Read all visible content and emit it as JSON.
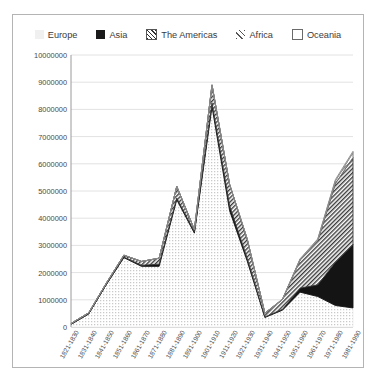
{
  "legend": {
    "position": "top-center",
    "entries": [
      {
        "label": "Europe",
        "swatch": "europe-dotted-swatch"
      },
      {
        "label": "Asia",
        "swatch": "asia-solid-swatch"
      },
      {
        "label": "The Americas",
        "swatch": "americas-hatch-swatch"
      },
      {
        "label": "Africa",
        "swatch": "africa-hatch-swatch"
      },
      {
        "label": "Oceania",
        "swatch": "oceania-outline-swatch"
      }
    ]
  },
  "chart_data": {
    "type": "area",
    "stacked": true,
    "title": "",
    "xlabel": "",
    "ylabel": "",
    "ylim": [
      0,
      10000000
    ],
    "ytick_step": 1000000,
    "grid": true,
    "ytick_labels": [
      "0",
      "1000000",
      "2000000",
      "3000000",
      "4000000",
      "5000000",
      "6000000",
      "7000000",
      "8000000",
      "9000000",
      "10000000"
    ],
    "categories": [
      "1821-1830",
      "1831-1840",
      "1841-1850",
      "1851-1860",
      "1861-1870",
      "1871-1880",
      "1881-1890",
      "1891-1900",
      "1901-1910",
      "1911-1920",
      "1921-1930",
      "1931-1940",
      "1941-1950",
      "1951-1960",
      "1961-1970",
      "1971-1980",
      "1981-1990"
    ],
    "series": [
      {
        "name": "Europe",
        "pattern": "dots",
        "color": "#efefef",
        "values": [
          100000,
          480000,
          1560000,
          2550000,
          2230000,
          2230000,
          4680000,
          3450000,
          8100000,
          4270000,
          2420000,
          350000,
          620000,
          1280000,
          1120000,
          790000,
          700000
        ]
      },
      {
        "name": "Asia",
        "pattern": "solid",
        "color": "#141414",
        "values": [
          0,
          0,
          0,
          20000,
          40000,
          80000,
          60000,
          50000,
          140000,
          190000,
          100000,
          20000,
          30000,
          150000,
          430000,
          1590000,
          2330000
        ]
      },
      {
        "name": "The Americas",
        "pattern": "hatch-dense",
        "color": "#3a3a3a",
        "values": [
          30000,
          40000,
          50000,
          70000,
          140000,
          220000,
          430000,
          80000,
          660000,
          780000,
          700000,
          140000,
          360000,
          1040000,
          1620000,
          2900000,
          3200000
        ]
      },
      {
        "name": "Africa",
        "pattern": "hatch-light",
        "color": "#6a6a6a",
        "values": [
          0,
          0,
          0,
          0,
          0,
          0,
          0,
          0,
          0,
          0,
          10000,
          0,
          10000,
          20000,
          40000,
          90000,
          180000
        ]
      },
      {
        "name": "Oceania",
        "pattern": "outline",
        "color": "#8a8a8a",
        "values": [
          0,
          0,
          0,
          0,
          0,
          0,
          0,
          0,
          0,
          0,
          10000,
          0,
          10000,
          20000,
          30000,
          50000,
          50000
        ]
      }
    ]
  }
}
